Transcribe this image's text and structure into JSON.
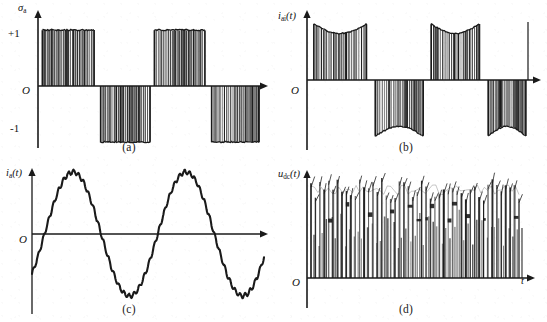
{
  "figure": {
    "kind": "multi-panel-waveform-figure",
    "panel_count": 4,
    "background_color": "#ffffff",
    "ink_color": "#1a1a1a"
  },
  "panels": [
    {
      "id": "a",
      "caption": "(a)",
      "y_axis_label_main": "σ",
      "y_axis_label_sub": "a",
      "y_axis_label_paren": "",
      "origin_label": "O",
      "tick_labels": [
        "+1",
        "-1"
      ],
      "x_axis_label": "",
      "signal_name": "switching-function",
      "description": "Bipolar PWM switching function alternating between +1 and -1 blocks",
      "chart_data": {
        "type": "line",
        "title": "",
        "xlabel": "",
        "ylabel": "sigma_a",
        "ylim": [
          -1.35,
          1.35
        ],
        "xlim": [
          0,
          1
        ],
        "grid": false,
        "levels": [
          1,
          -1
        ],
        "blocks": [
          {
            "start": 0.02,
            "end": 0.25,
            "level": 1
          },
          {
            "start": 0.28,
            "end": 0.5,
            "level": -1
          },
          {
            "start": 0.52,
            "end": 0.745,
            "level": 1
          },
          {
            "start": 0.775,
            "end": 0.985,
            "level": -1
          }
        ],
        "pulses_per_block": 23,
        "envelope": "flat"
      }
    },
    {
      "id": "b",
      "caption": "(b)",
      "y_axis_label_main": "i",
      "y_axis_label_sub": "ai",
      "y_axis_label_paren": "(t)",
      "origin_label": "O",
      "tick_labels": [],
      "x_axis_label": "",
      "signal_name": "inverter-side-current",
      "description": "Chopped current blocks with concave (dipped) envelopes, alternating polarity",
      "chart_data": {
        "type": "line",
        "title": "",
        "xlabel": "",
        "ylabel": "i_ai(t)",
        "ylim": [
          -1.35,
          1.35
        ],
        "xlim": [
          0,
          1
        ],
        "grid": false,
        "blocks": [
          {
            "start": 0.03,
            "end": 0.26,
            "level": 1,
            "envelope_dip": 0.17
          },
          {
            "start": 0.3,
            "end": 0.51,
            "level": -1,
            "envelope_dip": 0.17
          },
          {
            "start": 0.545,
            "end": 0.755,
            "level": 1,
            "envelope_dip": 0.17
          },
          {
            "start": 0.795,
            "end": 0.96,
            "level": -1,
            "envelope_dip": 0.17
          }
        ],
        "pulses_per_block": 22,
        "envelope": "concave"
      }
    },
    {
      "id": "c",
      "caption": "(c)",
      "y_axis_label_main": "i",
      "y_axis_label_sub": "a",
      "y_axis_label_paren": "(t)",
      "origin_label": "O",
      "tick_labels": [],
      "x_axis_label": "",
      "signal_name": "grid-side-current",
      "description": "Near-sinusoidal grid current, about two cycles, with small high-frequency ripple",
      "chart_data": {
        "type": "line",
        "title": "",
        "xlabel": "",
        "ylabel": "i_a(t)",
        "ylim": [
          -1.25,
          1.25
        ],
        "xlim": [
          0,
          1
        ],
        "grid": false,
        "cycles": 2.05,
        "amplitude": 1.0,
        "phase_deg": -40,
        "ripple_amplitude": 0.035,
        "ripple_cycles": 46
      }
    },
    {
      "id": "d",
      "caption": "(d)",
      "y_axis_label_main": "u",
      "y_axis_label_sub": "dc",
      "y_axis_label_paren": "(t)",
      "origin_label": "O",
      "tick_labels": [],
      "x_axis_label": "t",
      "signal_name": "dc-link-voltage",
      "description": "DC-link voltage: dense positive spike train with varying peak heights",
      "chart_data": {
        "type": "line",
        "title": "",
        "xlabel": "t",
        "ylabel": "u_dc(t)",
        "ylim": [
          0,
          1.15
        ],
        "xlim": [
          0,
          1
        ],
        "grid": false,
        "spike_count": 48,
        "baseline": 0,
        "peak_mean": 0.9,
        "peak_variation": 0.12
      }
    }
  ]
}
